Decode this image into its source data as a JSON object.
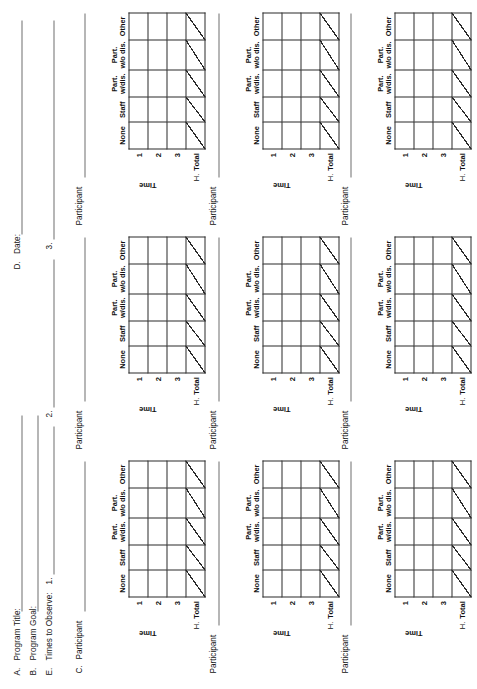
{
  "form": {
    "header": {
      "program_title": {
        "letter": "A.",
        "label": "Program Title:"
      },
      "program_goal": {
        "letter": "B.",
        "label": "Program Goal:"
      },
      "date": {
        "letter": "D.",
        "label": "Date:"
      },
      "times_to_observe": {
        "letter": "E.",
        "label": "Times to Observe:",
        "slots": [
          "1.",
          "2.",
          "3."
        ]
      }
    },
    "table": {
      "column_headers": [
        {
          "line1": "None",
          "line2": ""
        },
        {
          "line1": "Staff",
          "line2": ""
        },
        {
          "line1": "Part.",
          "line2": "w/dis."
        },
        {
          "line1": "Part.",
          "line2": "w/o dis."
        },
        {
          "line1": "Other",
          "line2": ""
        }
      ],
      "time_axis_label": "Time",
      "row_headers": [
        "1",
        "2",
        "3"
      ],
      "total_row": {
        "letter": "H.",
        "label": "Total"
      }
    },
    "participants": [
      {
        "letter": "C.",
        "label": "Participant"
      },
      {
        "letter": "",
        "label": "Participant"
      },
      {
        "letter": "",
        "label": "Participant"
      },
      {
        "letter": "",
        "label": "Participant"
      },
      {
        "letter": "",
        "label": "Participant"
      },
      {
        "letter": "",
        "label": "Participant"
      },
      {
        "letter": "",
        "label": "Participant"
      },
      {
        "letter": "",
        "label": "Participant"
      },
      {
        "letter": "",
        "label": "Participant"
      }
    ]
  }
}
